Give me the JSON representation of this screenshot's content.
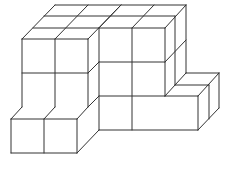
{
  "diagram": {
    "title": "",
    "stroke_color": "#333333",
    "background": "#ffffff",
    "cube_size_px": 33,
    "depth_step_px": [
      11,
      -11
    ],
    "structure": {
      "depth": 3,
      "columns": [
        {
          "name": "left-tower",
          "height": 2,
          "front_width": 2
        },
        {
          "name": "middle-tower",
          "height": 3,
          "front_width": 2
        },
        {
          "name": "left-low-step",
          "height": 1,
          "front_width": 2
        },
        {
          "name": "right-low-step",
          "height": 1,
          "front_width": 1
        }
      ]
    }
  }
}
